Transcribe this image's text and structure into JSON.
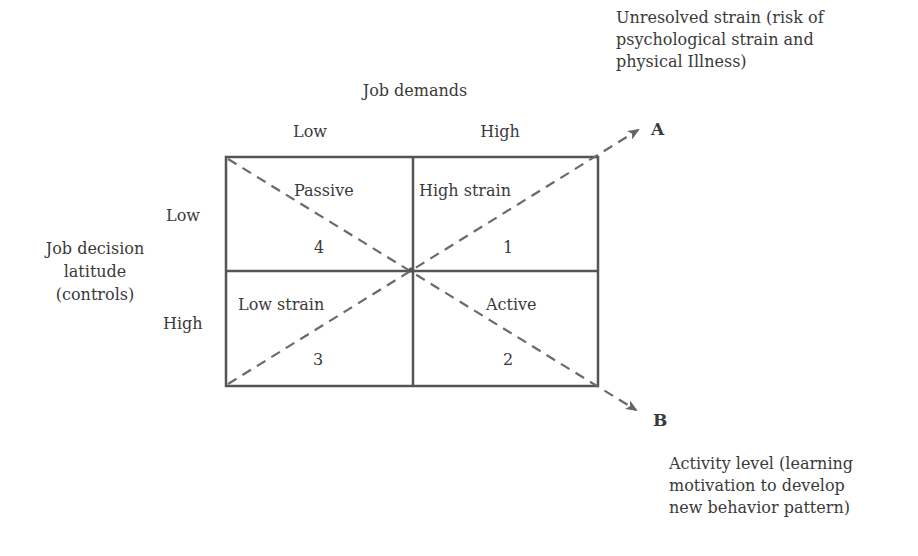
{
  "x_axis": {
    "title": "Job demands",
    "low_label": "Low",
    "high_label": "High"
  },
  "y_axis": {
    "title": "Job decision\nlatitude\n(controls)",
    "low_label": "Low",
    "high_label": "High"
  },
  "quadrants": [
    {
      "name": "Passive",
      "number": "4",
      "position": "top-left"
    },
    {
      "name": "High strain",
      "number": "1",
      "position": "top-right"
    },
    {
      "name": "Low strain",
      "number": "3",
      "position": "bottom-left"
    },
    {
      "name": "Active",
      "number": "2",
      "position": "bottom-right"
    }
  ],
  "arrows": {
    "a": {
      "letter": "A",
      "description": "Unresolved strain (risk of\npsychological strain and\nphysical Illness)"
    },
    "b": {
      "letter": "B",
      "description": "Activity level (learning\nmotivation to develop\nnew behavior pattern)"
    }
  },
  "colors": {
    "line": "#555555",
    "dash": "#6a6a6a",
    "text": "#3a3a3a"
  }
}
